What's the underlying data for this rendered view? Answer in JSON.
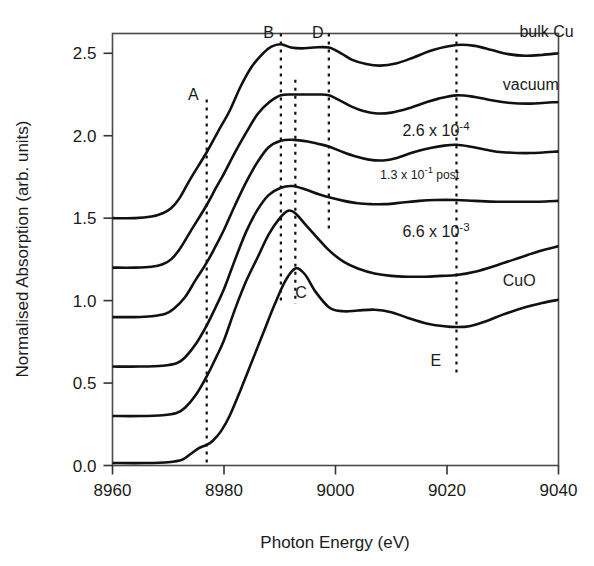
{
  "chart_data": {
    "type": "line",
    "title": "",
    "xlabel": "Photon Energy (eV)",
    "ylabel": "Normalised Absorption (arb. units)",
    "xlim": [
      8960,
      9040
    ],
    "ylim": [
      0.0,
      2.62
    ],
    "xticks": [
      8960,
      8980,
      9000,
      9020,
      9040
    ],
    "xtick_labels": [
      "8960",
      "8980",
      "9000",
      "9020",
      "9040"
    ],
    "yticks": [
      0.0,
      0.5,
      1.0,
      1.5,
      2.0,
      2.5
    ],
    "ytick_labels": [
      "0.0",
      "0.5",
      "1.0",
      "1.5",
      "2.0",
      "2.5"
    ],
    "grid": false,
    "legend_position": "inline-right-of-each-curve",
    "series": [
      {
        "name": "bulk Cu",
        "label": "bulk Cu",
        "label_style": "plain",
        "offset": 1.5,
        "label_x": 9033,
        "label_y": 2.6,
        "x": [
          8960,
          8964,
          8967,
          8969,
          8970.5,
          8972,
          8974,
          8976.9,
          8979,
          8981,
          8983,
          8985,
          8987,
          8988.5,
          8990.2,
          8992,
          8994,
          8996,
          8998.8,
          9001,
          9003,
          9005.5,
          9008,
          9011,
          9014,
          9017.5,
          9021.7,
          9025,
          9028,
          9031,
          9034,
          9037,
          9040
        ],
        "y": [
          1.5,
          1.5,
          1.51,
          1.53,
          1.56,
          1.62,
          1.74,
          1.9,
          2.03,
          2.15,
          2.3,
          2.42,
          2.5,
          2.54,
          2.555,
          2.535,
          2.53,
          2.535,
          2.535,
          2.5,
          2.46,
          2.435,
          2.425,
          2.44,
          2.475,
          2.52,
          2.55,
          2.545,
          2.52,
          2.495,
          2.485,
          2.49,
          2.5
        ]
      },
      {
        "name": "vacuum",
        "label": "vacuum",
        "label_style": "plain",
        "offset": 1.2,
        "label_x": 9030,
        "label_y": 2.28,
        "x": [
          8960,
          8964,
          8967,
          8969,
          8970.5,
          8972,
          8974,
          8976.9,
          8978.5,
          8980,
          8982,
          8984,
          8986,
          8988,
          8990.2,
          8992.5,
          8995,
          8997,
          8998.8,
          9001,
          9003,
          9005,
          9007.5,
          9010,
          9013,
          9016,
          9018.5,
          9021.7,
          9025,
          9028,
          9031,
          9035,
          9040
        ],
        "y": [
          1.2,
          1.2,
          1.205,
          1.22,
          1.25,
          1.31,
          1.42,
          1.58,
          1.68,
          1.77,
          1.9,
          2.02,
          2.13,
          2.2,
          2.245,
          2.25,
          2.25,
          2.25,
          2.245,
          2.21,
          2.175,
          2.15,
          2.135,
          2.14,
          2.165,
          2.2,
          2.225,
          2.245,
          2.235,
          2.215,
          2.2,
          2.195,
          2.205
        ]
      },
      {
        "name": "2.6e-4",
        "label": "2.6 x 10",
        "label_sup": "-4",
        "label_style": "sci",
        "offset": 0.9,
        "label_x": 9012,
        "label_y": 2.0,
        "x": [
          8960,
          8964,
          8967,
          8969.5,
          8971,
          8973,
          8975,
          8976.9,
          8978.5,
          8980,
          8982,
          8984,
          8986,
          8988,
          8990.2,
          8992.5,
          8995,
          8997,
          8998.8,
          9001,
          9003.5,
          9006,
          9008.5,
          9011,
          9014,
          9017,
          9019.5,
          9021.7,
          9024,
          9027,
          9030,
          9035,
          9040
        ],
        "y": [
          0.9,
          0.9,
          0.905,
          0.92,
          0.95,
          1.02,
          1.13,
          1.23,
          1.33,
          1.43,
          1.58,
          1.72,
          1.84,
          1.93,
          1.97,
          1.975,
          1.965,
          1.95,
          1.935,
          1.905,
          1.875,
          1.855,
          1.85,
          1.865,
          1.9,
          1.925,
          1.94,
          1.945,
          1.935,
          1.915,
          1.9,
          1.895,
          1.905
        ]
      },
      {
        "name": "1.3e-1 post",
        "label": "1.3 x 10",
        "label_sup": "-1",
        "label_suffix": " post",
        "label_style": "sci-small",
        "offset": 0.6,
        "label_x": 9008,
        "label_y": 1.735,
        "x": [
          8960,
          8965,
          8969,
          8971.5,
          8973,
          8975,
          8976.9,
          8978.5,
          8980,
          8982,
          8984,
          8986,
          8988,
          8990.2,
          8992.3,
          8994.5,
          8997,
          8999,
          9001.5,
          9004,
          9006.5,
          9009,
          9012,
          9015,
          9018,
          9021.7,
          9025,
          9029,
          9033,
          9036.5,
          9040
        ],
        "y": [
          0.6,
          0.6,
          0.605,
          0.62,
          0.655,
          0.74,
          0.85,
          0.96,
          1.07,
          1.25,
          1.42,
          1.55,
          1.64,
          1.685,
          1.695,
          1.675,
          1.645,
          1.625,
          1.605,
          1.59,
          1.585,
          1.585,
          1.595,
          1.605,
          1.61,
          1.61,
          1.605,
          1.6,
          1.6,
          1.6,
          1.605
        ]
      },
      {
        "name": "6.6e-3",
        "label": "6.6 x 10",
        "label_sup": "-3",
        "label_style": "sci",
        "offset": 0.3,
        "label_x": 9012,
        "label_y": 1.385,
        "x": [
          8960,
          8965,
          8969,
          8971.5,
          8973,
          8975,
          8976.9,
          8978.5,
          8980,
          8982,
          8984,
          8986,
          8988,
          8990,
          8991.5,
          8992.8,
          8994.5,
          8996.5,
          8999,
          9001.5,
          9004,
          9007,
          9010,
          9013,
          9016,
          9019,
          9021.7,
          9025,
          9029,
          9033,
          9036.5,
          9040
        ],
        "y": [
          0.3,
          0.3,
          0.305,
          0.318,
          0.35,
          0.43,
          0.54,
          0.65,
          0.76,
          0.95,
          1.12,
          1.26,
          1.4,
          1.5,
          1.545,
          1.53,
          1.465,
          1.39,
          1.3,
          1.235,
          1.195,
          1.165,
          1.15,
          1.145,
          1.145,
          1.15,
          1.155,
          1.175,
          1.215,
          1.26,
          1.3,
          1.33
        ]
      },
      {
        "name": "CuO",
        "label": "CuO",
        "label_style": "plain",
        "offset": 0.0,
        "label_x": 9030,
        "label_y": 1.09,
        "x": [
          8960,
          8966,
          8970,
          8972.5,
          8974,
          8975.5,
          8976.9,
          8978,
          8979.5,
          8981,
          8983,
          8985,
          8987,
          8989,
          8991,
          8992.8,
          8994.5,
          8996.5,
          8999,
          9001.5,
          9004,
          9007,
          9010,
          9013,
          9016.5,
          9019.5,
          9021.7,
          9024,
          9027,
          9030,
          9034,
          9037,
          9040
        ],
        "y": [
          0.015,
          0.015,
          0.02,
          0.035,
          0.07,
          0.105,
          0.125,
          0.15,
          0.21,
          0.3,
          0.46,
          0.63,
          0.8,
          0.97,
          1.12,
          1.195,
          1.16,
          1.05,
          0.955,
          0.935,
          0.94,
          0.945,
          0.93,
          0.895,
          0.86,
          0.845,
          0.84,
          0.845,
          0.875,
          0.915,
          0.96,
          0.985,
          1.005
        ]
      }
    ],
    "annotations": [
      {
        "label": "A",
        "x": 8976.9,
        "label_x": 8974.5,
        "label_y": 2.24,
        "line_top": 2.22,
        "line_bottom": -0.02
      },
      {
        "label": "B",
        "x": 8990.2,
        "label_x": 8988.0,
        "label_y": 2.62,
        "line_top": 2.62,
        "line_bottom": 1.0
      },
      {
        "label": "C",
        "x": 8992.8,
        "label_x": 8993.8,
        "label_y": 1.04,
        "line_top": 2.34,
        "line_bottom": 0.98
      },
      {
        "label": "D",
        "x": 8998.8,
        "label_x": 8996.8,
        "label_y": 2.62,
        "line_top": 2.62,
        "line_bottom": 1.42
      },
      {
        "label": "E",
        "x": 9021.7,
        "label_x": 9018.0,
        "label_y": 0.63,
        "line_top": 2.62,
        "line_bottom": 0.55
      }
    ]
  },
  "colors": {
    "curve": "#111111",
    "frame": "#4a4a4a",
    "text": "#1a1a1a",
    "background": "#ffffff"
  }
}
